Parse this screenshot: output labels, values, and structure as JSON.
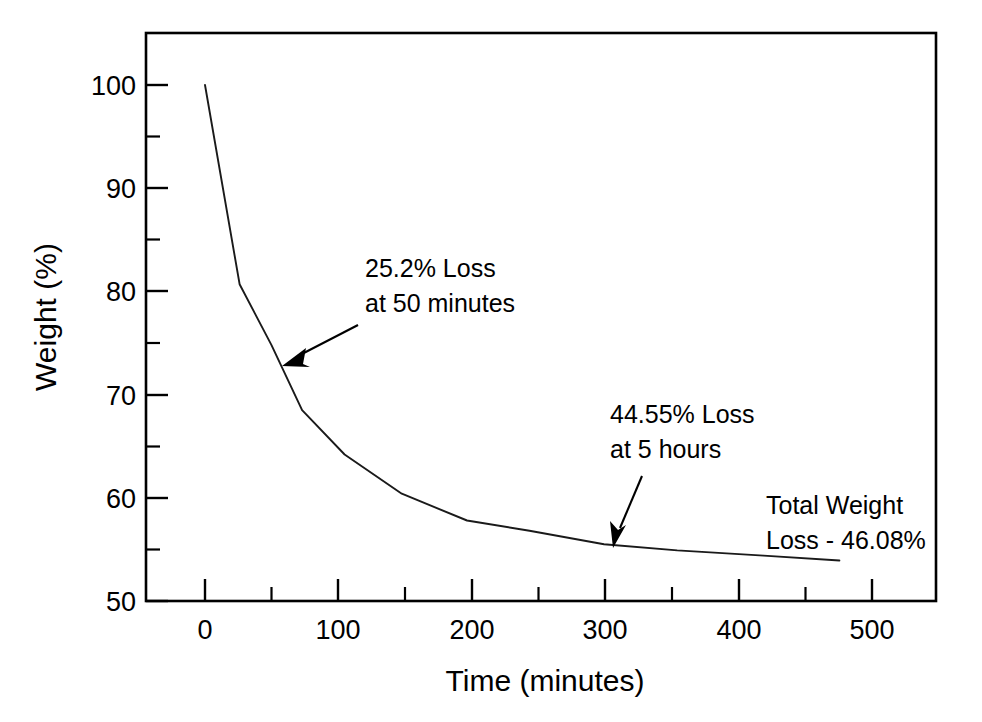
{
  "chart_data": {
    "type": "line",
    "title": "",
    "xlabel": "Time (minutes)",
    "ylabel": "Weight (%)",
    "xlim": [
      -45,
      550
    ],
    "ylim": [
      50,
      105
    ],
    "xticks": [
      0,
      100,
      200,
      300,
      400,
      500
    ],
    "xticklabels": [
      "0",
      "100",
      "200",
      "300",
      "400",
      "500"
    ],
    "xminorticks": [
      50,
      150,
      250,
      350,
      450
    ],
    "yticks": [
      50,
      60,
      70,
      80,
      90,
      100
    ],
    "yticklabels": [
      "50",
      "60",
      "70",
      "80",
      "90",
      "100"
    ],
    "yminorticks": [
      55,
      65,
      75,
      85,
      95
    ],
    "grid": false,
    "legend": null,
    "series": [
      {
        "name": "Weight loss",
        "x": [
          0,
          26,
          50,
          73,
          105,
          148,
          197,
          244,
          300,
          355,
          420,
          477
        ],
        "y": [
          100.0,
          80.7,
          74.8,
          68.5,
          64.2,
          60.4,
          57.8,
          56.8,
          55.5,
          54.9,
          54.4,
          53.92
        ]
      }
    ],
    "annotations": [
      {
        "id": "annotation-50min",
        "lines": [
          "25.2% Loss",
          "at 50 minutes"
        ],
        "points_to_x": 50,
        "points_to_y": 74.8
      },
      {
        "id": "annotation-5hours",
        "lines": [
          "44.55% Loss",
          "at 5 hours"
        ],
        "points_to_x": 300,
        "points_to_y": 55.45
      },
      {
        "id": "annotation-total-loss",
        "lines": [
          "Total Weight",
          "Loss - 46.08%"
        ],
        "points_to_x": null,
        "points_to_y": null
      }
    ],
    "colors": {
      "curve": "#1a1a1a",
      "axis": "#000000",
      "background": "#ffffff"
    }
  },
  "axes": {
    "x_title": "Time (minutes)",
    "y_title": "Weight (%)",
    "x_tick_labels": [
      "0",
      "100",
      "200",
      "300",
      "400",
      "500"
    ],
    "y_tick_labels": [
      "100",
      "90",
      "80",
      "70",
      "60",
      "50"
    ]
  },
  "annotations": {
    "first": {
      "line1": "25.2% Loss",
      "line2": "at 50 minutes"
    },
    "second": {
      "line1": "44.55% Loss",
      "line2": "at 5 hours"
    },
    "third": {
      "line1": "Total Weight",
      "line2": "Loss - 46.08%"
    }
  }
}
